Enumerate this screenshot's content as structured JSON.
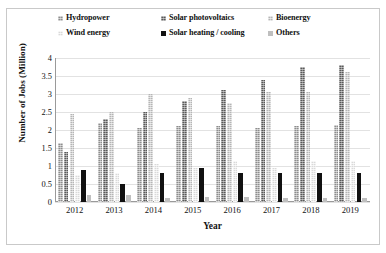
{
  "chart_data": {
    "type": "bar",
    "title": "",
    "xlabel": "Year",
    "ylabel": "Number of Jobs (Million)",
    "categories": [
      "2012",
      "2013",
      "2014",
      "2015",
      "2016",
      "2017",
      "2018",
      "2019"
    ],
    "ylim": [
      0,
      4
    ],
    "yticks": [
      "0",
      "0.5",
      "1",
      "1.5",
      "2",
      "2.5",
      "3",
      "3.5",
      "4"
    ],
    "ytick_values": [
      0,
      0.5,
      1,
      1.5,
      2,
      2.5,
      3,
      3.5,
      4
    ],
    "grid": true,
    "legend_position": "top",
    "series": [
      {
        "name": "Hydropower",
        "color": "#8d8d8d",
        "values": [
          1.65,
          2.2,
          2.05,
          2.1,
          2.1,
          2.05,
          2.1,
          2.15
        ]
      },
      {
        "name": "Solar photovoltaics",
        "color": "#595959",
        "values": [
          1.4,
          2.3,
          2.5,
          2.8,
          3.1,
          3.4,
          3.75,
          3.8
        ]
      },
      {
        "name": "Bioenergy",
        "color": "#b5b5b5",
        "values": [
          2.45,
          2.5,
          3.0,
          2.9,
          2.75,
          3.05,
          3.05,
          3.6
        ]
      },
      {
        "name": "Wind energy",
        "color": "#d9d9d9",
        "values": [
          0.75,
          0.8,
          1.05,
          0.95,
          1.15,
          0.95,
          1.15,
          1.15
        ]
      },
      {
        "name": "Solar heating / cooling",
        "color": "#111111",
        "values": [
          0.9,
          0.5,
          0.8,
          0.95,
          0.8,
          0.8,
          0.8,
          0.8
        ]
      },
      {
        "name": "Others",
        "color": "#bfbfbf",
        "values": [
          0.2,
          0.2,
          0.1,
          0.15,
          0.15,
          0.1,
          0.1,
          0.1
        ]
      }
    ]
  },
  "legend": {
    "items": [
      {
        "label": "Hydropower"
      },
      {
        "label": "Solar photovoltaics"
      },
      {
        "label": "Bioenergy"
      },
      {
        "label": "Wind energy"
      },
      {
        "label": "Solar heating / cooling"
      },
      {
        "label": "Others"
      }
    ]
  }
}
